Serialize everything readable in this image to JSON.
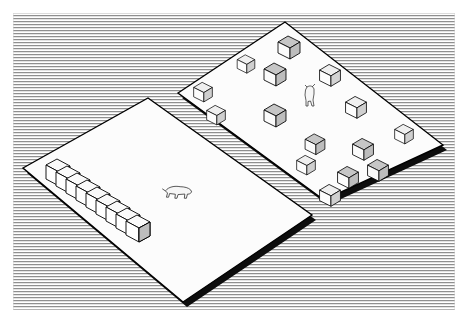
{
  "illustration": {
    "title": "Isometric comparison of two land plots",
    "style": "black-and-white line art, engraved horizontal hatching background",
    "canvas": {
      "width": 466,
      "height": 323
    },
    "background": {
      "name": "hatched-field",
      "hatch_line_color": "#8a8a8a",
      "hatch_period_px": 3,
      "region": {
        "x": 13,
        "y": 13,
        "width": 442,
        "height": 297
      },
      "page_color": "#ffffff"
    },
    "colors": {
      "outline": "#000000",
      "plot_face": "#fcfcfc",
      "plot_edge_shadow": "#111111",
      "roof_light": "#f2f2f2",
      "roof_shade": "#bfbfbf",
      "wall_light": "#fafafa",
      "wall_shade": "#d8d8d8",
      "animal_fill": "#f6f6f6"
    }
  },
  "plots": [
    {
      "id": "left-plot",
      "name": "left-land-plot",
      "label": "Left plot with long shed",
      "corners": {
        "left": [
          23,
          168
        ],
        "top": [
          148,
          98
        ],
        "right": [
          312,
          215
        ],
        "bottom": [
          183,
          302
        ]
      },
      "edge_shadow_offset": [
        4,
        5
      ],
      "structures_count": 1,
      "animals_count": 1
    },
    {
      "id": "right-plot",
      "name": "right-land-plot",
      "label": "Right plot with scattered houses",
      "corners": {
        "left": [
          178,
          93
        ],
        "top": [
          285,
          22
        ],
        "right": [
          443,
          145
        ],
        "bottom": [
          324,
          200
        ]
      },
      "edge_shadow_offset": [
        4,
        5
      ],
      "structures_count": 15,
      "animals_count": 1
    }
  ],
  "long_shed": {
    "name": "long-segmented-shed",
    "label": "Long segmented barn / greenhouse row",
    "segment_count": 9,
    "start": [
      46,
      165
    ],
    "end": [
      131,
      222
    ],
    "segment_step": [
      10.6,
      7.1
    ],
    "width": 13,
    "height": 14
  },
  "houses": [
    {
      "id": "h1",
      "x": 289,
      "y": 45,
      "scale": 1.0,
      "roof_shaded": true
    },
    {
      "id": "h2",
      "x": 275,
      "y": 72,
      "scale": 1.0,
      "roof_shaded": true
    },
    {
      "id": "h3",
      "x": 330,
      "y": 73,
      "scale": 0.95,
      "roof_shaded": false
    },
    {
      "id": "h4",
      "x": 203,
      "y": 90,
      "scale": 0.85,
      "roof_shaded": false
    },
    {
      "id": "h5",
      "x": 216,
      "y": 113,
      "scale": 0.85,
      "roof_shaded": false
    },
    {
      "id": "h6",
      "x": 275,
      "y": 113,
      "scale": 1.0,
      "roof_shaded": true
    },
    {
      "id": "h7",
      "x": 356,
      "y": 105,
      "scale": 0.95,
      "roof_shaded": false
    },
    {
      "id": "h8",
      "x": 315,
      "y": 142,
      "scale": 0.9,
      "roof_shaded": true
    },
    {
      "id": "h9",
      "x": 363,
      "y": 147,
      "scale": 0.95,
      "roof_shaded": true
    },
    {
      "id": "h10",
      "x": 306,
      "y": 163,
      "scale": 0.85,
      "roof_shaded": false
    },
    {
      "id": "h11",
      "x": 404,
      "y": 132,
      "scale": 0.85,
      "roof_shaded": false
    },
    {
      "id": "h12",
      "x": 348,
      "y": 175,
      "scale": 0.95,
      "roof_shaded": true
    },
    {
      "id": "h13",
      "x": 378,
      "y": 168,
      "scale": 0.95,
      "roof_shaded": true
    },
    {
      "id": "h14",
      "x": 330,
      "y": 193,
      "scale": 0.95,
      "roof_shaded": false
    },
    {
      "id": "h15",
      "x": 246,
      "y": 62,
      "scale": 0.8,
      "roof_shaded": false
    }
  ],
  "animals": [
    {
      "id": "a1",
      "name": "cow-right-plot",
      "x": 310,
      "y": 95,
      "scale": 1.0,
      "facing": "up"
    },
    {
      "id": "a2",
      "name": "cow-left-plot",
      "x": 178,
      "y": 193,
      "scale": 1.0,
      "facing": "right"
    }
  ]
}
